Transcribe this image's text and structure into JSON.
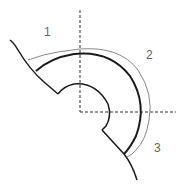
{
  "diagram": {
    "labels": [
      {
        "id": "region-1",
        "text": "1"
      },
      {
        "id": "region-2",
        "text": "2"
      },
      {
        "id": "region-3",
        "text": "3"
      }
    ],
    "colors": {
      "thick_line": "#1a1a1a",
      "thin_line": "#888888",
      "dashed_axis": "#333333",
      "label": "#666666",
      "background": "#ffffff"
    },
    "center": {
      "x": 80,
      "y": 112
    },
    "radii": {
      "inner": 29,
      "outer_thick": 59,
      "outer_thin": 66
    }
  }
}
